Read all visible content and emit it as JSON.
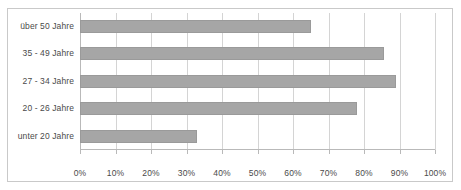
{
  "chart_data": {
    "type": "bar",
    "orientation": "horizontal",
    "title": "",
    "subtitle": "",
    "xlabel": "",
    "ylabel": "",
    "categories": [
      "unter 20 Jahre",
      "20 - 26 Jahre",
      "27 - 34 Jahre",
      "35 - 49 Jahre",
      "über 50 Jahre"
    ],
    "values": [
      33,
      78,
      89,
      85.5,
      65
    ],
    "value_suffix": "%",
    "xlim": [
      0,
      100
    ],
    "xticks": [
      0,
      10,
      20,
      30,
      40,
      50,
      60,
      70,
      80,
      90,
      100
    ],
    "xtick_labels": [
      "0%",
      "10%",
      "20%",
      "30%",
      "40%",
      "50%",
      "60%",
      "70%",
      "80%",
      "90%",
      "100%"
    ],
    "grid": true,
    "grid_axis": "x",
    "legend": false,
    "legend_position": "none",
    "bar_color": "#a6a6a6",
    "bar_border_color": "#9a9a9a",
    "grid_color": "#d4d4d4",
    "axis_color": "#b9b9b9",
    "frame_color": "#c9c9c9",
    "background_color": "#ffffff",
    "text_color": "#4a4a4a",
    "series": [
      {
        "name": "Anteil",
        "values": [
          33,
          78,
          89,
          85.5,
          65
        ]
      }
    ],
    "points": [
      {
        "category": "unter 20 Jahre",
        "value": 33
      },
      {
        "category": "20 - 26 Jahre",
        "value": 78
      },
      {
        "category": "27 - 34 Jahre",
        "value": 89
      },
      {
        "category": "35 - 49 Jahre",
        "value": 85.5
      },
      {
        "category": "über 50 Jahre",
        "value": 65
      }
    ]
  }
}
